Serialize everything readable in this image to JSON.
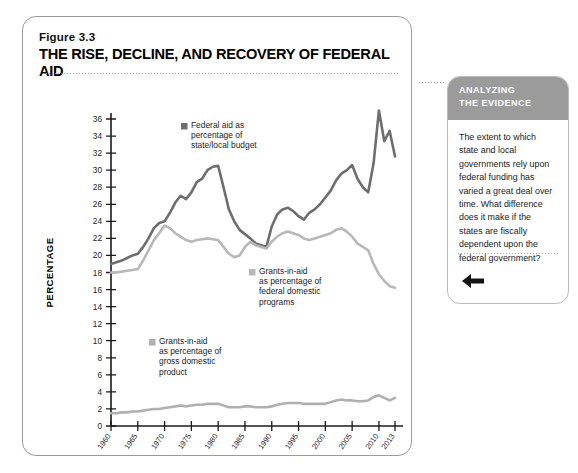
{
  "figure": {
    "number": "Figure 3.3",
    "title": "THE RISE, DECLINE, AND RECOVERY OF FEDERAL AID"
  },
  "sidebar": {
    "header_line1": "ANALYZING",
    "header_line2": "THE EVIDENCE",
    "body": "The extent to which state and local governments rely upon federal funding has varied a great deal over time. What difference does it make if the states are fiscally dependent upon the federal government?",
    "back_icon": "left-arrow-icon"
  },
  "colors": {
    "federal_aid_line": "#6e6e6e",
    "domestic_programs_line": "#b8b8b8",
    "gdp_line": "#b0b0b0",
    "axis": "#1a1a1a",
    "panel_header_bg": "#9b9b9b"
  },
  "chart_data": {
    "type": "line",
    "title": "THE RISE, DECLINE, AND RECOVERY OF FEDERAL AID",
    "xlabel": "YEAR",
    "ylabel": "PERCENTAGE",
    "xlim": [
      1960,
      2013
    ],
    "ylim": [
      0,
      36
    ],
    "ytick_step": 2,
    "grid": false,
    "legend_position": "inline-annotations",
    "xticks": [
      "1960",
      "1965",
      "1970",
      "1975",
      "1980",
      "1985",
      "1990",
      "1995",
      "2000",
      "2005",
      "2010",
      "2013"
    ],
    "yticks": [
      "0",
      "2",
      "4",
      "6",
      "8",
      "10",
      "12",
      "14",
      "16",
      "18",
      "20",
      "22",
      "24",
      "26",
      "28",
      "30",
      "32",
      "34",
      "36"
    ],
    "x": [
      1960,
      1961,
      1962,
      1963,
      1964,
      1965,
      1966,
      1967,
      1968,
      1969,
      1970,
      1971,
      1972,
      1973,
      1974,
      1975,
      1976,
      1977,
      1978,
      1979,
      1980,
      1981,
      1982,
      1983,
      1984,
      1985,
      1986,
      1987,
      1988,
      1989,
      1990,
      1991,
      1992,
      1993,
      1994,
      1995,
      1996,
      1997,
      1998,
      1999,
      2000,
      2001,
      2002,
      2003,
      2004,
      2005,
      2006,
      2007,
      2008,
      2009,
      2010,
      2011,
      2012,
      2013
    ],
    "series": [
      {
        "name": "Federal aid as percentage of state/local budget",
        "color": "#6e6e6e",
        "label_lines": [
          "Federal aid as",
          "percentage of",
          "state/local budget"
        ],
        "values": [
          19.0,
          19.2,
          19.4,
          19.7,
          20.0,
          20.2,
          21.0,
          22.0,
          23.2,
          23.8,
          24.0,
          25.0,
          26.2,
          27.0,
          26.6,
          27.4,
          28.6,
          29.0,
          30.0,
          30.4,
          30.5,
          28.0,
          25.4,
          24.0,
          23.0,
          22.5,
          22.0,
          21.4,
          21.2,
          21.0,
          23.4,
          24.8,
          25.4,
          25.6,
          25.2,
          24.6,
          24.2,
          25.0,
          25.4,
          26.0,
          26.8,
          27.6,
          28.8,
          29.6,
          30.0,
          30.6,
          29.0,
          28.0,
          27.4,
          30.8,
          37.0,
          33.4,
          34.6,
          31.6
        ]
      },
      {
        "name": "Grants-in-aid as percentage of federal domestic programs",
        "color": "#b8b8b8",
        "label_lines": [
          "Grants-in-aid",
          "as percentage of",
          "federal domestic",
          "programs"
        ],
        "values": [
          18.0,
          18.0,
          18.1,
          18.2,
          18.3,
          18.4,
          19.4,
          20.6,
          21.8,
          22.6,
          23.5,
          23.2,
          22.6,
          22.2,
          21.8,
          21.6,
          21.8,
          21.9,
          22.0,
          21.9,
          21.8,
          21.0,
          20.2,
          19.8,
          20.0,
          21.0,
          21.6,
          21.2,
          21.0,
          20.8,
          21.6,
          22.2,
          22.6,
          22.8,
          22.6,
          22.4,
          22.0,
          21.8,
          22.0,
          22.2,
          22.4,
          22.6,
          23.0,
          23.2,
          22.8,
          22.2,
          21.4,
          21.0,
          20.6,
          19.0,
          17.8,
          17.0,
          16.4,
          16.2
        ]
      },
      {
        "name": "Grants-in-aid as percentage of gross domestic product",
        "color": "#b0b0b0",
        "label_lines": [
          "Grants-in-aid",
          "as percentage of",
          "gross domestic",
          "product"
        ],
        "values": [
          1.5,
          1.5,
          1.6,
          1.6,
          1.7,
          1.7,
          1.8,
          1.9,
          2.0,
          2.0,
          2.1,
          2.2,
          2.3,
          2.4,
          2.3,
          2.4,
          2.5,
          2.5,
          2.6,
          2.6,
          2.6,
          2.4,
          2.2,
          2.2,
          2.2,
          2.3,
          2.3,
          2.2,
          2.2,
          2.2,
          2.3,
          2.5,
          2.6,
          2.7,
          2.7,
          2.7,
          2.6,
          2.6,
          2.6,
          2.6,
          2.6,
          2.8,
          3.0,
          3.1,
          3.0,
          3.0,
          2.9,
          2.9,
          3.0,
          3.4,
          3.6,
          3.3,
          3.0,
          3.3
        ]
      }
    ]
  }
}
